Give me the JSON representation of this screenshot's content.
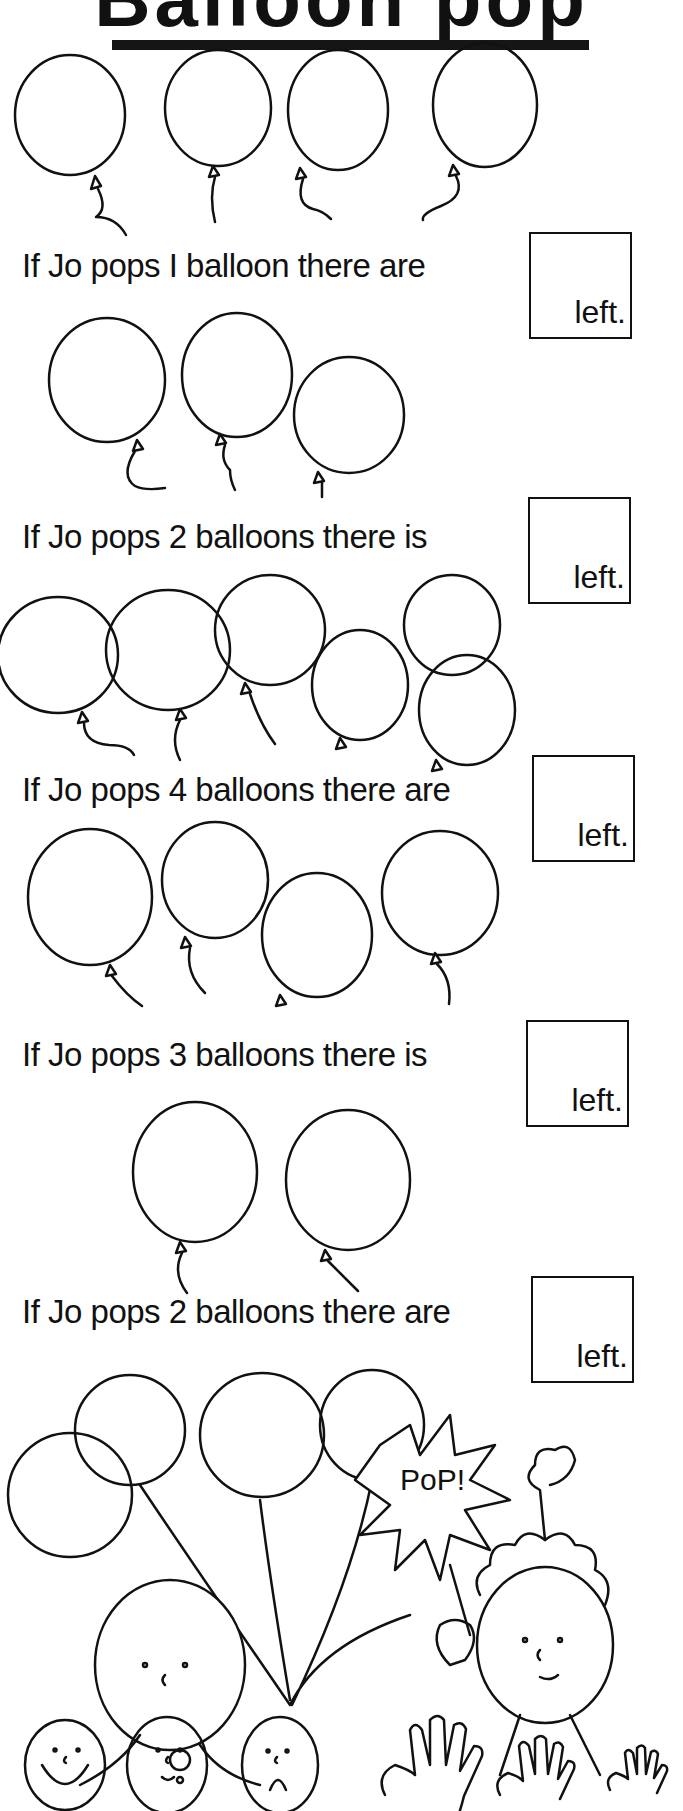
{
  "worksheet": {
    "title": "Balloon pop",
    "questions": [
      {
        "text": "If Jo pops I balloon there are",
        "answer_suffix": "left.",
        "balloons_shown": 4
      },
      {
        "text": "If Jo pops 2 balloons there is",
        "answer_suffix": "left.",
        "balloons_shown": 3
      },
      {
        "text": "If Jo pops 4 balloons there are",
        "answer_suffix": "left.",
        "balloons_shown": 6
      },
      {
        "text": "If Jo pops 3 balloons there is",
        "answer_suffix": "left.",
        "balloons_shown": 4
      },
      {
        "text": "If Jo pops 2 balloons there are",
        "answer_suffix": "left.",
        "balloons_shown": 2
      }
    ],
    "illustration": {
      "burst_text": "PoP!",
      "self_assessment_faces": [
        "happy-face",
        "neutral-face",
        "sad-face"
      ],
      "self_assessment_hands": [
        "large-hand",
        "medium-hand",
        "small-hand"
      ]
    }
  }
}
